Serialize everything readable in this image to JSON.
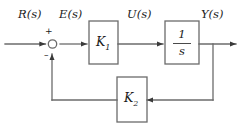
{
  "diagram": {
    "type": "block-diagram",
    "background_color": "#ffffff",
    "line_color": "#6b6b6b",
    "text_color": "#1a1a1a",
    "signals": {
      "input": "R(s)",
      "error": "E(s)",
      "control": "U(s)",
      "output": "Y(s)"
    },
    "summing_junction": {
      "plus_sign": "+",
      "minus_sign": "–"
    },
    "blocks": {
      "gain1": "K",
      "gain1_subscript": "1",
      "integrator_numerator": "1",
      "integrator_denominator": "s",
      "gain2": "K",
      "gain2_subscript": "2"
    }
  }
}
